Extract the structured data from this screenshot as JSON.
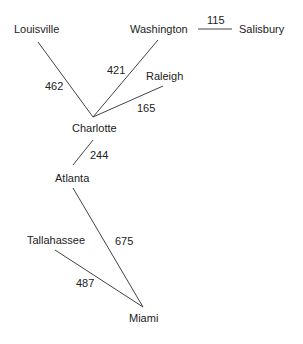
{
  "diagram": {
    "type": "weighted-graph",
    "nodes": [
      {
        "id": "louisville",
        "label": "Louisville",
        "x": 14,
        "y": 24
      },
      {
        "id": "washington",
        "label": "Washington",
        "x": 130,
        "y": 24
      },
      {
        "id": "salisbury",
        "label": "Salisbury",
        "x": 239,
        "y": 24
      },
      {
        "id": "raleigh",
        "label": "Raleigh",
        "x": 146,
        "y": 71
      },
      {
        "id": "charlotte",
        "label": "Charlotte",
        "x": 72,
        "y": 123
      },
      {
        "id": "atlanta",
        "label": "Atlanta",
        "x": 55,
        "y": 173
      },
      {
        "id": "tallahassee",
        "label": "Tallahassee",
        "x": 27,
        "y": 235
      },
      {
        "id": "miami",
        "label": "Miami",
        "x": 129,
        "y": 313
      }
    ],
    "edges": [
      {
        "from": "louisville",
        "to": "charlotte",
        "weight": "462",
        "x1": 38,
        "y1": 42,
        "x2": 93,
        "y2": 117,
        "lx": 45,
        "ly": 81
      },
      {
        "from": "washington",
        "to": "charlotte",
        "weight": "421",
        "x1": 158,
        "y1": 40,
        "x2": 93,
        "y2": 117,
        "lx": 107,
        "ly": 65
      },
      {
        "from": "washington",
        "to": "salisbury",
        "weight": "115",
        "x1": 198,
        "y1": 29,
        "x2": 232,
        "y2": 29,
        "lx": 207,
        "ly": 15
      },
      {
        "from": "raleigh",
        "to": "charlotte",
        "weight": "165",
        "x1": 163,
        "y1": 86,
        "x2": 93,
        "y2": 117,
        "lx": 137,
        "ly": 103
      },
      {
        "from": "charlotte",
        "to": "atlanta",
        "weight": "244",
        "x1": 93,
        "y1": 140,
        "x2": 73,
        "y2": 165,
        "lx": 90,
        "ly": 150
      },
      {
        "from": "atlanta",
        "to": "miami",
        "weight": "675",
        "x1": 73,
        "y1": 188,
        "x2": 143,
        "y2": 307,
        "lx": 115,
        "ly": 236
      },
      {
        "from": "tallahassee",
        "to": "miami",
        "weight": "487",
        "x1": 55,
        "y1": 250,
        "x2": 143,
        "y2": 307,
        "lx": 76,
        "ly": 278
      }
    ]
  }
}
